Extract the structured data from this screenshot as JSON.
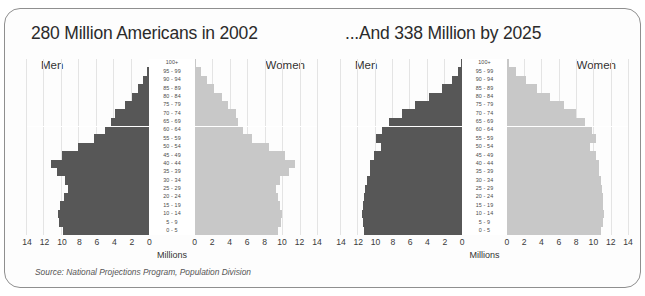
{
  "figure": {
    "source_note": "Source:  National Projections Program, Population Division",
    "men_label": "Men",
    "women_label": "Women",
    "axis_title": "Millions",
    "colors": {
      "men_bar": "#575757",
      "women_bar": "#c8c8c8",
      "grid": "#e4e4e4",
      "frame": "#8f8f8f"
    }
  },
  "chart_data": [
    {
      "type": "bar",
      "subtype": "population-pyramid",
      "title": "280 Million Americans in 2002",
      "xlabel": "Millions",
      "ylabel": "",
      "xlim": [
        -14,
        14
      ],
      "xticks": [
        14,
        12,
        10,
        8,
        6,
        4,
        2,
        0,
        0,
        2,
        4,
        6,
        8,
        10,
        12,
        14
      ],
      "grid": true,
      "legend": [
        "Men",
        "Women"
      ],
      "categories": [
        "100+",
        "95 - 99",
        "90 - 94",
        "85 - 89",
        "80 - 84",
        "75 - 79",
        "70 - 74",
        "65 - 69",
        "60 - 64",
        "55 - 59",
        "50 - 54",
        "45 - 49",
        "40 - 44",
        "35 - 39",
        "30 - 34",
        "25 - 29",
        "20 - 24",
        "15 - 19",
        "10 - 14",
        "5 - 9",
        "0 - 5"
      ],
      "series": [
        {
          "name": "Men",
          "values": [
            0.05,
            0.3,
            0.7,
            1.3,
            2.0,
            2.8,
            3.9,
            4.4,
            5.1,
            6.3,
            8.2,
            10.0,
            11.3,
            10.6,
            9.6,
            9.3,
            9.8,
            10.2,
            10.5,
            10.3,
            9.9
          ]
        },
        {
          "name": "Women",
          "values": [
            0.15,
            0.7,
            1.4,
            2.2,
            3.1,
            3.8,
            4.7,
            5.0,
            5.5,
            6.6,
            8.5,
            10.3,
            11.5,
            10.8,
            9.8,
            9.3,
            9.5,
            9.8,
            10.0,
            9.9,
            9.5
          ]
        }
      ]
    },
    {
      "type": "bar",
      "subtype": "population-pyramid",
      "title": "...And 338 Million by 2025",
      "xlabel": "Millions",
      "ylabel": "",
      "xlim": [
        -14,
        14
      ],
      "xticks": [
        14,
        12,
        10,
        8,
        6,
        4,
        2,
        0,
        0,
        2,
        4,
        6,
        8,
        10,
        12,
        14
      ],
      "grid": true,
      "legend": [
        "Men",
        "Women"
      ],
      "categories": [
        "100+",
        "95 - 99",
        "90 - 94",
        "85 - 89",
        "80 - 84",
        "75 - 79",
        "70 - 74",
        "65 - 69",
        "60 - 64",
        "55 - 59",
        "50 - 54",
        "45 - 49",
        "40 - 44",
        "35 - 39",
        "30 - 34",
        "25 - 29",
        "20 - 24",
        "15 - 19",
        "10 - 14",
        "5 - 9",
        "0 - 5"
      ],
      "series": [
        {
          "name": "Men",
          "values": [
            0.1,
            0.5,
            1.2,
            2.3,
            3.8,
            5.4,
            7.0,
            8.4,
            9.3,
            9.9,
            9.4,
            10.2,
            10.6,
            10.7,
            11.0,
            11.2,
            11.3,
            11.5,
            11.6,
            11.5,
            11.4
          ]
        },
        {
          "name": "Women",
          "values": [
            0.3,
            1.1,
            2.2,
            3.5,
            5.0,
            6.6,
            8.0,
            9.0,
            9.8,
            10.3,
            9.6,
            10.3,
            10.6,
            10.7,
            10.9,
            11.0,
            11.1,
            11.1,
            11.2,
            11.1,
            10.9
          ]
        }
      ]
    }
  ]
}
